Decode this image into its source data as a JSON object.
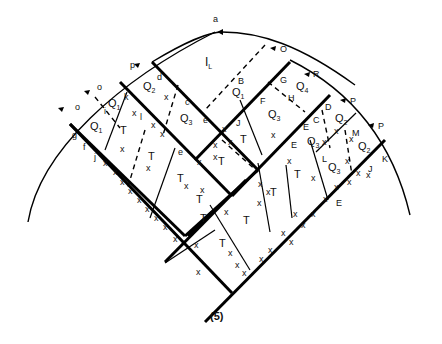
{
  "figure": {
    "caption": "(5)",
    "top_label": "a",
    "region_label_IL": "I",
    "region_label_IL_sub": "L",
    "left_side": {
      "arc_labels": [
        "p",
        "o",
        "o"
      ],
      "boundary_labels": [
        "d",
        "k",
        "i",
        "g",
        "f",
        "j",
        "c",
        "e",
        "l"
      ],
      "regions": [
        {
          "name": "Q",
          "sub": "2"
        },
        {
          "name": "Q",
          "sub": "1"
        },
        {
          "name": "Q",
          "sub": "1"
        },
        {
          "name": "Q",
          "sub": "3"
        }
      ]
    },
    "right_side": {
      "arc_labels": [
        "O",
        "R",
        "P",
        "P"
      ],
      "boundary_labels": [
        "B",
        "G",
        "H",
        "F",
        "J",
        "D",
        "C",
        "E",
        "E",
        "M",
        "L",
        "K",
        "J",
        "E"
      ],
      "regions": [
        {
          "name": "Q",
          "sub": "1"
        },
        {
          "name": "Q",
          "sub": "4"
        },
        {
          "name": "Q",
          "sub": "3"
        },
        {
          "name": "Q",
          "sub": "2"
        },
        {
          "name": "Q",
          "sub": "3"
        },
        {
          "name": "Q",
          "sub": "2"
        },
        {
          "name": "Q",
          "sub": "3"
        }
      ]
    },
    "T_label": "T",
    "x_mark": "x"
  }
}
